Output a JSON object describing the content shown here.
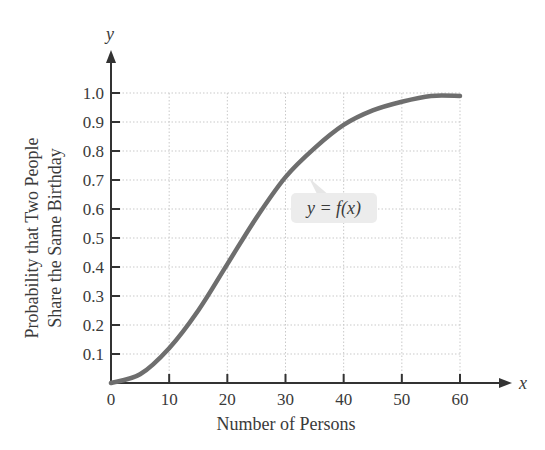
{
  "chart_data": {
    "type": "line",
    "title": "",
    "xlabel": "Number of Persons",
    "ylabel": [
      "Probability that Two People",
      "Share the Same Birthday"
    ],
    "x_axis_var": "x",
    "y_axis_var": "y",
    "xlim": [
      0,
      60
    ],
    "ylim": [
      0,
      1.0
    ],
    "x_ticks": [
      0,
      10,
      20,
      30,
      40,
      50,
      60
    ],
    "x_tick_labels": [
      "0",
      "10",
      "20",
      "30",
      "40",
      "50",
      "60"
    ],
    "y_ticks": [
      0.1,
      0.2,
      0.3,
      0.4,
      0.5,
      0.6,
      0.7,
      0.8,
      0.9,
      1.0
    ],
    "y_tick_labels": [
      "0.1",
      "0.2",
      "0.3",
      "0.4",
      "0.5",
      "0.6",
      "0.7",
      "0.8",
      "0.9",
      "1.0"
    ],
    "grid": true,
    "series": [
      {
        "name": "y = f(x)",
        "x": [
          0,
          5,
          10,
          15,
          20,
          25,
          30,
          35,
          40,
          45,
          50,
          55,
          60
        ],
        "values": [
          0.0,
          0.03,
          0.12,
          0.25,
          0.41,
          0.57,
          0.71,
          0.81,
          0.89,
          0.94,
          0.97,
          0.99,
          0.99
        ]
      }
    ],
    "annotations": [
      {
        "text": "y = f(x)",
        "x": 32,
        "y": 0.56
      }
    ]
  },
  "colors": {
    "curve": "#6e6e6e",
    "axis": "#333333",
    "grid": "#c9c9c9",
    "label_box": "#ececec"
  }
}
